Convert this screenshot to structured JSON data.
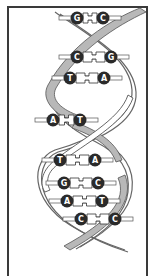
{
  "figure": {
    "colors": {
      "frame": "#3a3a3a",
      "ribbon_front": "#b8b8b8",
      "ribbon_outline": "#555555",
      "backbone_line": "#666666",
      "base_circle": "#2a2a2a",
      "base_letter": "#ffffff",
      "connector": "#ffffff"
    },
    "base_pairs": [
      {
        "left": "G",
        "right": "C",
        "y": 18,
        "lx": 77,
        "rx": 103
      },
      {
        "left": "C",
        "right": "G",
        "y": 57,
        "lx": 77,
        "rx": 111
      },
      {
        "left": "T",
        "right": "A",
        "y": 78,
        "lx": 70,
        "rx": 104
      },
      {
        "left": "A",
        "right": "T",
        "y": 120,
        "lx": 53,
        "rx": 80
      },
      {
        "left": "T",
        "right": "A",
        "y": 160,
        "lx": 60,
        "rx": 95
      },
      {
        "left": "G",
        "right": "C",
        "y": 183,
        "lx": 64,
        "rx": 98
      },
      {
        "left": "A",
        "right": "T",
        "y": 201,
        "lx": 67,
        "rx": 102
      },
      {
        "left": "C",
        "right": "C",
        "y": 219,
        "lx": 81,
        "rx": 115
      }
    ]
  }
}
